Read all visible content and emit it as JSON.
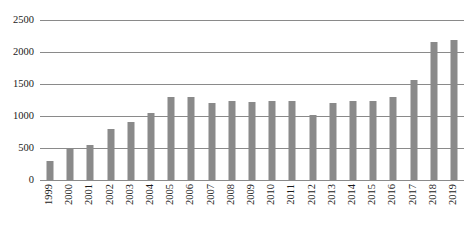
{
  "chart_data": {
    "type": "bar",
    "title": "",
    "xlabel": "",
    "ylabel": "",
    "ylim": [
      0,
      2500
    ],
    "yticks": [
      0,
      500,
      1000,
      1500,
      2000,
      2500
    ],
    "ytick_labels": [
      "0",
      "500",
      "1000",
      "1500",
      "2000",
      "2500"
    ],
    "grid": true,
    "legend": false,
    "bar_color": "#8a8a8a",
    "axis_color": "#8a8a8a",
    "text_color": "#1a1a1a",
    "categories": [
      "1999",
      "2000",
      "2001",
      "2002",
      "2003",
      "2004",
      "2005",
      "2006",
      "2007",
      "2008",
      "2009",
      "2010",
      "2011",
      "2012",
      "2013",
      "2014",
      "2015",
      "2016",
      "2017",
      "2018",
      "2019"
    ],
    "values": [
      300,
      490,
      540,
      800,
      900,
      1050,
      1300,
      1290,
      1210,
      1240,
      1220,
      1240,
      1240,
      1020,
      1200,
      1240,
      1240,
      1300,
      1560,
      2150,
      2190
    ]
  }
}
